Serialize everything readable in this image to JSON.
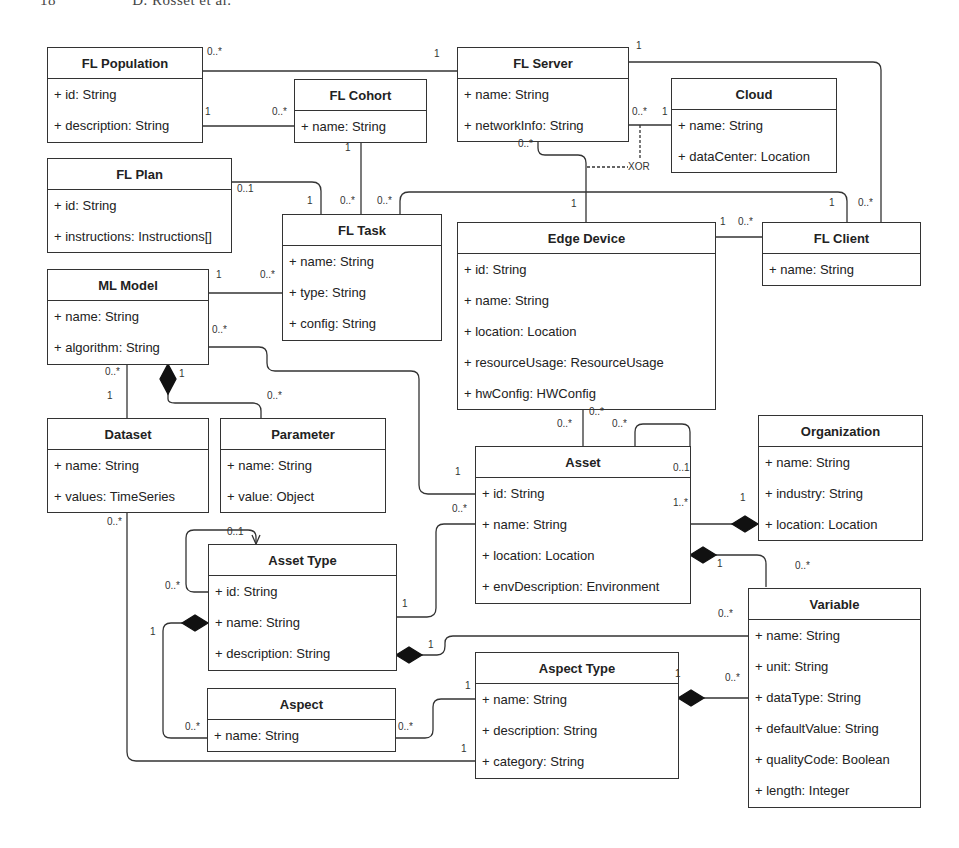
{
  "page": {
    "number": "18",
    "authors": "D. Rosset et al."
  },
  "classes": {
    "fl_population": {
      "name": "FL Population",
      "attrs": [
        "+ id: String",
        "+ description: String"
      ]
    },
    "fl_server": {
      "name": "FL Server",
      "attrs": [
        "+ name: String",
        "+ networkInfo: String"
      ]
    },
    "fl_cohort": {
      "name": "FL Cohort",
      "attrs": [
        "+ name: String"
      ]
    },
    "cloud": {
      "name": "Cloud",
      "attrs": [
        "+ name: String",
        "+ dataCenter: Location"
      ]
    },
    "fl_plan": {
      "name": "FL Plan",
      "attrs": [
        "+ id: String",
        "+ instructions: Instructions[]"
      ]
    },
    "fl_task": {
      "name": "FL Task",
      "attrs": [
        "+ name: String",
        "+ type: String",
        "+ config: String"
      ]
    },
    "edge_device": {
      "name": "Edge Device",
      "attrs": [
        "+ id: String",
        "+ name: String",
        "+ location: Location",
        "+ resourceUsage: ResourceUsage",
        "+ hwConfig: HWConfig"
      ]
    },
    "fl_client": {
      "name": "FL Client",
      "attrs": [
        "+ name: String"
      ]
    },
    "ml_model": {
      "name": "ML Model",
      "attrs": [
        "+ name: String",
        "+ algorithm: String"
      ]
    },
    "dataset": {
      "name": "Dataset",
      "attrs": [
        "+ name: String",
        "+ values: TimeSeries"
      ]
    },
    "parameter": {
      "name": "Parameter",
      "attrs": [
        "+ name: String",
        "+ value: Object"
      ]
    },
    "organization": {
      "name": "Organization",
      "attrs": [
        "+ name: String",
        "+ industry: String",
        "+ location: Location"
      ]
    },
    "asset": {
      "name": "Asset",
      "attrs": [
        "+ id: String",
        "+ name: String",
        "+ location: Location",
        "+ envDescription: Environment"
      ]
    },
    "asset_type": {
      "name": "Asset Type",
      "attrs": [
        "+ id: String",
        "+ name: String",
        "+ description: String"
      ]
    },
    "variable": {
      "name": "Variable",
      "attrs": [
        "+ name: String",
        "+ unit: String",
        "+ dataType: String",
        "+ defaultValue: String",
        "+ qualityCode: Boolean",
        "+ length: Integer"
      ]
    },
    "aspect_type": {
      "name": "Aspect Type",
      "attrs": [
        "+ name: String",
        "+ description: String",
        "+ category: String"
      ]
    },
    "aspect": {
      "name": "Aspect",
      "attrs": [
        "+ name: String"
      ]
    }
  },
  "constraint": {
    "xor": "XOR"
  },
  "multiplicities": [
    {
      "t": "0..*",
      "x": 207,
      "y": 52
    },
    {
      "t": "1",
      "x": 434,
      "y": 54
    },
    {
      "t": "1",
      "x": 205,
      "y": 112
    },
    {
      "t": "0..*",
      "x": 272,
      "y": 112
    },
    {
      "t": "1",
      "x": 345,
      "y": 148
    },
    {
      "t": "0..1",
      "x": 237,
      "y": 189
    },
    {
      "t": "1",
      "x": 307,
      "y": 201
    },
    {
      "t": "0..*",
      "x": 340,
      "y": 201
    },
    {
      "t": "0..*",
      "x": 377,
      "y": 201
    },
    {
      "t": "1",
      "x": 636,
      "y": 46
    },
    {
      "t": "0..*",
      "x": 632,
      "y": 112
    },
    {
      "t": "1",
      "x": 662,
      "y": 112
    },
    {
      "t": "0..*",
      "x": 518,
      "y": 144
    },
    {
      "t": "1",
      "x": 571,
      "y": 204
    },
    {
      "t": "1",
      "x": 829,
      "y": 203
    },
    {
      "t": "0..*",
      "x": 858,
      "y": 203
    },
    {
      "t": "1",
      "x": 720,
      "y": 222
    },
    {
      "t": "0..*",
      "x": 738,
      "y": 222
    },
    {
      "t": "1",
      "x": 216,
      "y": 275
    },
    {
      "t": "0..*",
      "x": 260,
      "y": 275
    },
    {
      "t": "0..*",
      "x": 212,
      "y": 330
    },
    {
      "t": "0..*",
      "x": 105,
      "y": 372
    },
    {
      "t": "1",
      "x": 179,
      "y": 374
    },
    {
      "t": "1",
      "x": 107,
      "y": 396
    },
    {
      "t": "0..*",
      "x": 267,
      "y": 396
    },
    {
      "t": "0..*",
      "x": 589,
      "y": 412
    },
    {
      "t": "0..*",
      "x": 557,
      "y": 424
    },
    {
      "t": "0..*",
      "x": 612,
      "y": 424
    },
    {
      "t": "1",
      "x": 455,
      "y": 472
    },
    {
      "t": "0..1",
      "x": 673,
      "y": 468
    },
    {
      "t": "0..*",
      "x": 452,
      "y": 509
    },
    {
      "t": "1..*",
      "x": 673,
      "y": 503
    },
    {
      "t": "1",
      "x": 740,
      "y": 498
    },
    {
      "t": "0..*",
      "x": 107,
      "y": 522
    },
    {
      "t": "0..1",
      "x": 227,
      "y": 532
    },
    {
      "t": "1",
      "x": 717,
      "y": 564
    },
    {
      "t": "0..*",
      "x": 795,
      "y": 566
    },
    {
      "t": "0..*",
      "x": 165,
      "y": 586
    },
    {
      "t": "1",
      "x": 402,
      "y": 604
    },
    {
      "t": "0..*",
      "x": 718,
      "y": 614
    },
    {
      "t": "1",
      "x": 150,
      "y": 632
    },
    {
      "t": "1",
      "x": 428,
      "y": 645
    },
    {
      "t": "1",
      "x": 675,
      "y": 674
    },
    {
      "t": "0..*",
      "x": 725,
      "y": 678
    },
    {
      "t": "1",
      "x": 465,
      "y": 686
    },
    {
      "t": "0..*",
      "x": 185,
      "y": 727
    },
    {
      "t": "0..*",
      "x": 398,
      "y": 727
    },
    {
      "t": "1",
      "x": 461,
      "y": 749
    }
  ]
}
